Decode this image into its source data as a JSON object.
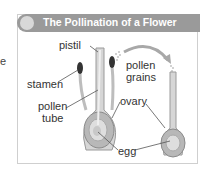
{
  "figure": {
    "title": "The Pollination of a Flower",
    "edge_fragment": "e",
    "labels": {
      "pistil": "pistil",
      "stamen": "stamen",
      "pollen_tube_line1": "pollen",
      "pollen_tube_line2": "tube",
      "pollen_grains_line1": "pollen",
      "pollen_grains_line2": "grains",
      "ovary": "ovary",
      "egg": "egg"
    },
    "colors": {
      "header": "#9a9a9a",
      "flower_tissue": "#c8c8c8",
      "ovary_fill": "#b0b0b0",
      "stamen_tip": "#333333",
      "arrow": "#a8a8a8"
    }
  }
}
